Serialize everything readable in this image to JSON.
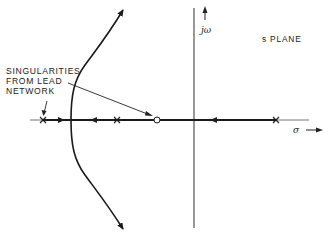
{
  "diagram": {
    "type": "root-locus",
    "plane_label": "s PLANE",
    "imag_axis_label": "jω",
    "real_axis_label": "σ",
    "annotation": {
      "lines": [
        "SINGULARITIES",
        "FROM LEAD",
        "NETWORK"
      ],
      "points_to": [
        "pole at far left",
        "zero (circle) on real axis"
      ]
    },
    "real_axis_singularities": [
      {
        "kind": "pole",
        "symbol": "×",
        "x_px": 43,
        "note": "lead network pole"
      },
      {
        "kind": "pole",
        "symbol": "×",
        "x_px": 117
      },
      {
        "kind": "zero",
        "symbol": "○",
        "x_px": 157,
        "note": "lead network zero"
      },
      {
        "kind": "pole",
        "symbol": "×",
        "x_px": 276
      }
    ],
    "branches": [
      {
        "id": "upper-branch",
        "direction": "upward",
        "arrow": "to +jω (top)"
      },
      {
        "id": "lower-branch",
        "direction": "downward",
        "arrow": "to -jω (bottom)"
      },
      {
        "id": "real-segment-right",
        "direction": "leftward",
        "from": "pole at 276",
        "to": "zero at 157"
      },
      {
        "id": "real-segment-mid",
        "direction": "leftward",
        "from": "pole at 117",
        "to": "breakaway"
      },
      {
        "id": "real-segment-left",
        "direction": "rightward",
        "from": "pole at 43",
        "to": "breakaway"
      }
    ],
    "colors": {
      "line": "#1a1a1a",
      "axis": "#444444",
      "background": "#ffffff"
    }
  }
}
